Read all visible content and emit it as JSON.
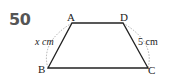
{
  "problem_number": "50",
  "figure": {
    "shape": "trapezoid",
    "vertices": {
      "A": "A",
      "B": "B",
      "C": "C",
      "D": "D"
    },
    "side_labels": {
      "AB": "x cm",
      "DC": "5 cm"
    }
  }
}
